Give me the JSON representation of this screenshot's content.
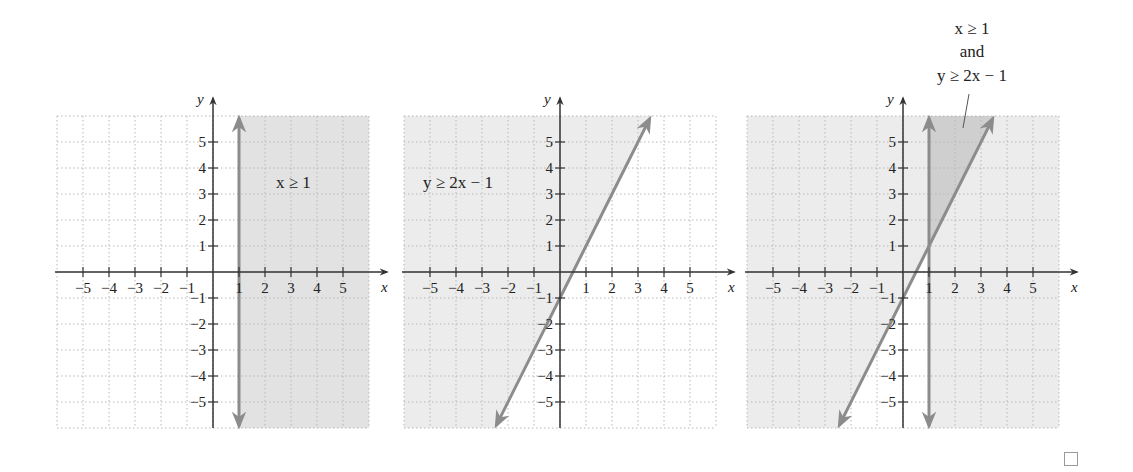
{
  "chart_data": [
    {
      "type": "region",
      "title": "x ≥ 1",
      "xlabel": "x",
      "ylabel": "y",
      "xlim": [
        -6,
        6
      ],
      "ylim": [
        -6,
        6
      ],
      "x_ticks": [
        -5,
        -4,
        -3,
        -2,
        -1,
        1,
        2,
        3,
        4,
        5
      ],
      "y_ticks": [
        -5,
        -4,
        -3,
        -2,
        -1,
        1,
        2,
        3,
        4,
        5
      ],
      "grid": true,
      "boundary": {
        "type": "vertical_line",
        "x": 1,
        "style": "solid"
      },
      "shaded_region": "x >= 1",
      "label": "x ≥ 1"
    },
    {
      "type": "region",
      "title": "y ≥ 2x − 1",
      "xlabel": "x",
      "ylabel": "y",
      "xlim": [
        -6,
        6
      ],
      "ylim": [
        -6,
        6
      ],
      "x_ticks": [
        -5,
        -4,
        -3,
        -2,
        -1,
        1,
        2,
        3,
        4,
        5
      ],
      "y_ticks": [
        -5,
        -4,
        -3,
        -2,
        -1,
        1,
        2,
        3,
        4,
        5
      ],
      "grid": true,
      "boundary": {
        "type": "line",
        "slope": 2,
        "intercept": -1,
        "style": "solid"
      },
      "shaded_region": "y >= 2x - 1",
      "label": "y ≥ 2x − 1"
    },
    {
      "type": "region",
      "title": "x ≥ 1 and y ≥ 2x − 1",
      "xlabel": "x",
      "ylabel": "y",
      "xlim": [
        -6,
        6
      ],
      "ylim": [
        -6,
        6
      ],
      "x_ticks": [
        -5,
        -4,
        -3,
        -2,
        -1,
        1,
        2,
        3,
        4,
        5
      ],
      "y_ticks": [
        -5,
        -4,
        -3,
        -2,
        -1,
        1,
        2,
        3,
        4,
        5
      ],
      "grid": true,
      "boundaries": [
        {
          "type": "vertical_line",
          "x": 1,
          "style": "solid"
        },
        {
          "type": "line",
          "slope": 2,
          "intercept": -1,
          "style": "solid"
        }
      ],
      "shaded_region": "x >= 1 and y >= 2x - 1",
      "intersection_point": [
        1,
        1
      ],
      "label": "x ≥ 1 and y ≥ 2x − 1"
    }
  ],
  "graphs": [
    {
      "label": "x ≥ 1"
    },
    {
      "label": "y ≥ 2x − 1"
    },
    {
      "label_line1": "x ≥ 1",
      "label_line2": "and",
      "label_line3": "y ≥ 2x − 1"
    }
  ],
  "axis": {
    "x_name": "x",
    "y_name": "y"
  },
  "ticks": {
    "x": [
      "−5",
      "−4",
      "−3",
      "−2",
      "−1",
      "1",
      "2",
      "3",
      "4",
      "5"
    ],
    "y": [
      "5",
      "4",
      "3",
      "2",
      "1",
      "−1",
      "−2",
      "−3",
      "−4",
      "−5"
    ]
  },
  "colors": {
    "grid": "#b8b8b8",
    "axis": "#333333",
    "boundary_line": "#8c8c8c",
    "shade_light": "#ececec",
    "shade_medium": "#e2e2e2",
    "shade_dark": "#cfcfcf"
  }
}
